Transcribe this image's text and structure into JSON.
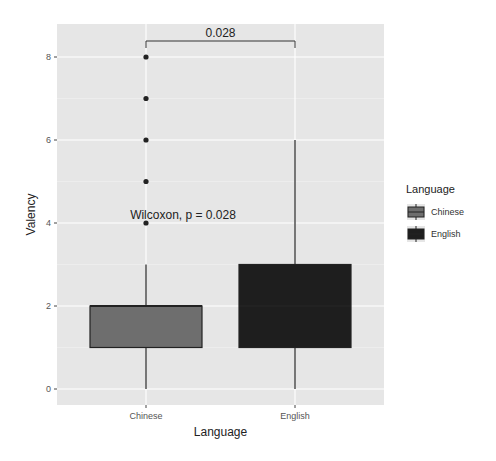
{
  "chart_data": {
    "type": "box",
    "title": "",
    "xlabel": "Language",
    "ylabel": "Valency",
    "ylim": [
      -0.3,
      8.2
    ],
    "yticks": [
      0,
      2,
      4,
      6,
      8
    ],
    "categories": [
      "Chinese",
      "English"
    ],
    "grid": true,
    "legend": {
      "title": "Language",
      "position": "right",
      "entries": [
        {
          "label": "Chinese",
          "color": "#6e6e6e"
        },
        {
          "label": "English",
          "color": "#1e1e1e"
        }
      ]
    },
    "series": [
      {
        "name": "Chinese",
        "whisker_low": 0,
        "q1": 1,
        "median": 2,
        "q3": 2,
        "whisker_high": 3,
        "outliers": [
          4,
          5,
          6,
          7,
          8
        ],
        "color": "#6e6e6e"
      },
      {
        "name": "English",
        "whisker_low": 0,
        "q1": 1,
        "median": 2,
        "q3": 3,
        "whisker_high": 6,
        "outliers": [],
        "color": "#1e1e1e"
      }
    ],
    "annotations": {
      "test_label": "Wilcoxon, p = 0.028",
      "bracket_label": "0.028"
    }
  }
}
